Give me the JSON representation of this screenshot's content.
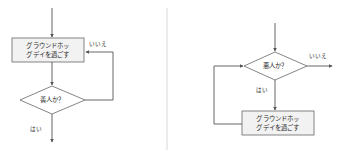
{
  "canvas": {
    "width": 341,
    "height": 157,
    "background": "#ffffff"
  },
  "colors": {
    "process_fill": "#f2f2f2",
    "decision_fill": "#ffffff",
    "node_stroke": "#666666",
    "edge_stroke": "#555555",
    "divider": "#d8d8d8",
    "text": "#2b2b2b"
  },
  "divider": {
    "name": "panel-divider",
    "x": 167,
    "y_top": 8,
    "y_bottom": 150
  },
  "diagrams": [
    {
      "id": "left",
      "name": "flowchart-left",
      "nodes": [
        {
          "id": "left-process",
          "type": "process",
          "line1": "グラウンドホッ",
          "line2": "グデイを過ごす",
          "full_text": "グラウンドホッグデイを過ごす"
        },
        {
          "id": "left-decision",
          "type": "decision",
          "line1": "善人か？",
          "full_text": "善人か？"
        }
      ],
      "edges": [
        {
          "id": "left-entry",
          "label": ""
        },
        {
          "id": "left-process-to-decision",
          "label": ""
        },
        {
          "id": "left-decision-no-loop",
          "label": "いいえ"
        },
        {
          "id": "left-decision-yes-exit",
          "label": "はい"
        }
      ]
    },
    {
      "id": "right",
      "name": "flowchart-right",
      "nodes": [
        {
          "id": "right-decision",
          "type": "decision",
          "line1": "悪人か？",
          "full_text": "悪人か？"
        },
        {
          "id": "right-process",
          "type": "process",
          "line1": "グラウンドホッ",
          "line2": "グデイを過ごす",
          "full_text": "グラウンドホッグデイを過ごす"
        }
      ],
      "edges": [
        {
          "id": "right-entry",
          "label": ""
        },
        {
          "id": "right-decision-no-exit",
          "label": "いいえ"
        },
        {
          "id": "right-decision-yes",
          "label": "はい"
        },
        {
          "id": "right-process-loop",
          "label": ""
        }
      ]
    }
  ]
}
